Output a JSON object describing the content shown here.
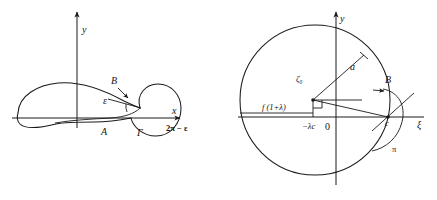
{
  "figure": {
    "panels": [
      {
        "id": "left-panel",
        "name": "airfoil-z-plane",
        "axes": {
          "x_label": "x",
          "y_label": "y"
        },
        "labels": {
          "point_a": "A",
          "point_gamma": "Γ",
          "point_b": "B",
          "angle_epsilon": "ε",
          "angle_two_pi_minus_epsilon": "2π − ε"
        }
      },
      {
        "id": "right-panel",
        "name": "circle-zeta-plane",
        "axes": {
          "x_label": "ξ",
          "y_label": "y"
        },
        "labels": {
          "center": "ζ₀",
          "radius": "a",
          "origin": "0",
          "left_offset": "−λc",
          "chord_label": "f (1+λ)",
          "point_c": "c",
          "point_b": "B",
          "angle_pi": "π"
        }
      }
    ],
    "colors": {
      "stroke": "#1a1a1a",
      "text": "#151515",
      "background": "#ffffff"
    }
  }
}
